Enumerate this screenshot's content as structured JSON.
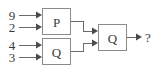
{
  "diagram": {
    "type": "block-dataflow-diagram",
    "background_color": "#ffffff",
    "line_color": "#6b6b6b",
    "box_border_color": "#8a8a8a",
    "box_fill_color": "#ffffff",
    "text_color": "#3a3a3a",
    "inputs": [
      {
        "id": "in-1",
        "label": "9",
        "target": "block-p"
      },
      {
        "id": "in-2",
        "label": "2",
        "target": "block-p"
      },
      {
        "id": "in-3",
        "label": "4",
        "target": "block-q-lower"
      },
      {
        "id": "in-4",
        "label": "3",
        "target": "block-q-lower"
      }
    ],
    "blocks": [
      {
        "id": "block-p",
        "label": "P"
      },
      {
        "id": "block-q-lower",
        "label": "Q"
      },
      {
        "id": "block-q-output",
        "label": "Q"
      }
    ],
    "connections": [
      {
        "from": "block-p",
        "to": "block-q-output"
      },
      {
        "from": "block-q-lower",
        "to": "block-q-output"
      }
    ],
    "output": {
      "id": "out-1",
      "label": "?",
      "source": "block-q-output"
    }
  }
}
